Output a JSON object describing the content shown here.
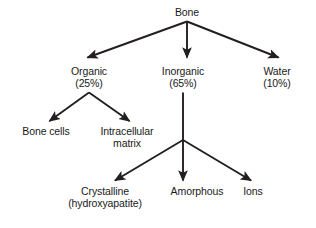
{
  "diagram": {
    "background_color": "#ffffff",
    "line_color": "#231f20",
    "text_color": "#1a1a1a",
    "nodes": {
      "bone": {
        "label": "Bone"
      },
      "organic": {
        "label": "Organic",
        "value": "(25%)"
      },
      "inorganic": {
        "label": "Inorganic",
        "value": "(65%)"
      },
      "water": {
        "label": "Water",
        "value": "(10%)"
      },
      "bone_cells": {
        "label": "Bone cells"
      },
      "intracellular_matrix": {
        "label": "Intracellular",
        "line2": "matrix"
      },
      "crystalline": {
        "label": "Crystalline",
        "line2": "(hydroxyapatite)"
      },
      "amorphous": {
        "label": "Amorphous"
      },
      "ions": {
        "label": "Ions"
      }
    },
    "edges": [
      {
        "from": "bone",
        "to": "organic"
      },
      {
        "from": "bone",
        "to": "inorganic"
      },
      {
        "from": "bone",
        "to": "water"
      },
      {
        "from": "organic",
        "to": "bone_cells"
      },
      {
        "from": "organic",
        "to": "intracellular_matrix"
      },
      {
        "from": "inorganic",
        "to": "crystalline"
      },
      {
        "from": "inorganic",
        "to": "amorphous"
      },
      {
        "from": "inorganic",
        "to": "ions"
      }
    ]
  }
}
